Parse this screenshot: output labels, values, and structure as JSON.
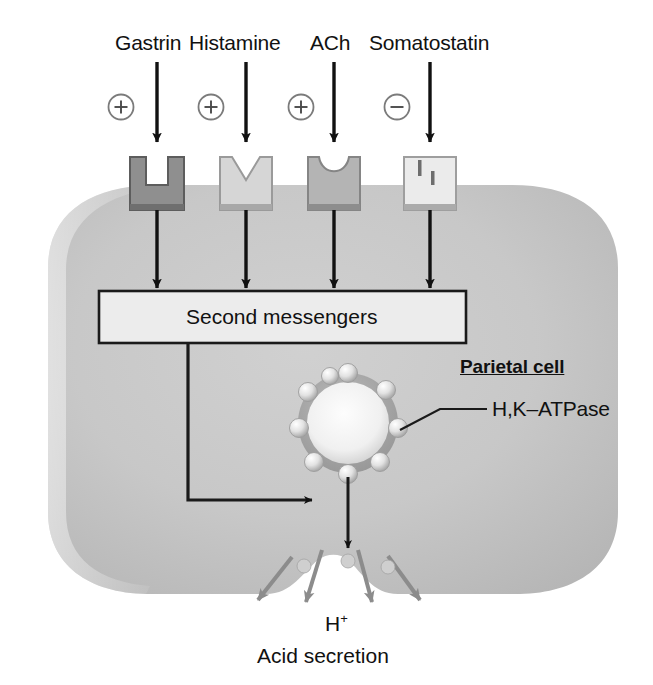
{
  "figure": {
    "background_color": "#ffffff",
    "cell_fill_color": "#c3c3c3",
    "box_fill_color": "#ececec",
    "line_color": "#111111"
  },
  "ligands": [
    {
      "label": "Gastrin",
      "sign": "+",
      "sign_name": "plus",
      "receptor_shade": "#8f8f8f",
      "receptor_notch": "square"
    },
    {
      "label": "Histamine",
      "sign": "+",
      "sign_name": "plus",
      "receptor_shade": "#d6d6d6",
      "receptor_notch": "v-notch"
    },
    {
      "label": "ACh",
      "sign": "+",
      "sign_name": "plus",
      "receptor_shade": "#b4b4b4",
      "receptor_notch": "u-notch"
    },
    {
      "label": "Somatostatin",
      "sign": "−",
      "sign_name": "minus",
      "receptor_shade": "#ebebeb",
      "receptor_notch": "slits"
    }
  ],
  "second_messengers": {
    "label": "Second messengers"
  },
  "cell": {
    "title": "Parietal cell"
  },
  "vesicle": {
    "pump_label": "H,K–ATPase",
    "pump_count": 9
  },
  "secretion": {
    "ion_label": "H",
    "ion_charge": "+",
    "caption": "Acid secretion",
    "arrow_count": 4
  }
}
